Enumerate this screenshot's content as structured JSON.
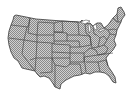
{
  "map": {
    "title": "United States map",
    "fill_light": "#d8d8d8",
    "fill_dark": "#8c8c8c",
    "border": "#3a3a3a",
    "background": "#ffffff"
  }
}
